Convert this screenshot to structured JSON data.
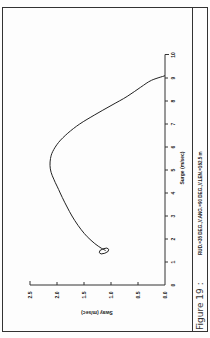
{
  "figure": {
    "label": "Figure 19 :",
    "params": "RUD.=35 DEG.,V.ANG.=90 DEG.,V.LEN.=162.5 m"
  },
  "axes": {
    "surge": {
      "title": "Surge (m/sec)",
      "ticks": [
        "0",
        "1",
        "2",
        "3",
        "4",
        "5",
        "6",
        "7",
        "8",
        "9",
        "10"
      ]
    },
    "sway": {
      "title": "Sway (m/sec)",
      "ticks": [
        "0.0",
        "0.5",
        "1.0",
        "1.5",
        "2.0",
        "2.5"
      ]
    }
  },
  "chart_data": {
    "type": "line",
    "title": "",
    "caption": "Figure 19 : RUD.=35 DEG.,V.ANG.=90 DEG.,V.LEN.=162.5 m",
    "xlabel": "Surge (m/sec)",
    "ylabel": "Sway (m/sec)",
    "xlim": [
      0,
      10
    ],
    "ylim": [
      0.0,
      2.5
    ],
    "x_ticks": [
      0,
      1,
      2,
      3,
      4,
      5,
      6,
      7,
      8,
      9,
      10
    ],
    "y_ticks": [
      0.0,
      0.5,
      1.0,
      1.5,
      2.0,
      2.5
    ],
    "grid": false,
    "legend": null,
    "orientation_note": "figure printed rotated 90 degrees counter-clockwise",
    "series": [
      {
        "name": "Surge vs Sway trajectory",
        "x": [
          9.1,
          8.9,
          8.6,
          8.2,
          7.8,
          7.4,
          7.0,
          6.6,
          6.2,
          5.8,
          5.5,
          5.2,
          4.9,
          4.6,
          4.3,
          4.0,
          3.6,
          3.2,
          2.8,
          2.4,
          2.1,
          1.8,
          1.6,
          1.5,
          1.45,
          1.5,
          1.6,
          1.55,
          1.45
        ],
        "y": [
          0.0,
          0.25,
          0.45,
          0.7,
          1.0,
          1.3,
          1.58,
          1.8,
          1.97,
          2.08,
          2.12,
          2.13,
          2.11,
          2.06,
          2.0,
          1.94,
          1.86,
          1.77,
          1.67,
          1.55,
          1.44,
          1.3,
          1.18,
          1.1,
          1.2,
          1.32,
          1.22,
          1.08,
          1.1
        ]
      }
    ]
  }
}
